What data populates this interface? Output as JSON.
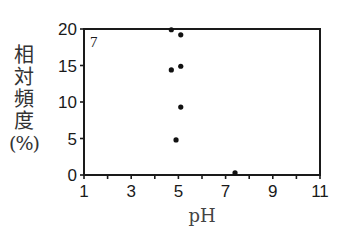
{
  "chart_data": {
    "type": "scatter",
    "title": "",
    "panel_label": "7",
    "xlabel": "pH",
    "ylabel": "相対頻度(%)",
    "ylabel_chars": [
      "相",
      "対",
      "頻",
      "度",
      "(%)"
    ],
    "xlim": [
      1,
      11
    ],
    "ylim": [
      0,
      20
    ],
    "x_ticks": [
      1,
      2,
      3,
      4,
      5,
      6,
      7,
      8,
      9,
      10,
      11
    ],
    "x_tick_labels": [
      "1",
      "3",
      "5",
      "7",
      "9",
      "11"
    ],
    "x_tick_label_values": [
      1,
      3,
      5,
      7,
      9,
      11
    ],
    "y_ticks": [
      0,
      5,
      10,
      15,
      20
    ],
    "y_tick_labels": [
      "0",
      "5",
      "10",
      "15",
      "20"
    ],
    "grid": false,
    "legend": null,
    "points": [
      {
        "x": 4.7,
        "y": 19.9
      },
      {
        "x": 5.1,
        "y": 19.2
      },
      {
        "x": 4.7,
        "y": 14.4
      },
      {
        "x": 5.1,
        "y": 14.9
      },
      {
        "x": 5.1,
        "y": 9.3
      },
      {
        "x": 4.9,
        "y": 4.8
      },
      {
        "x": 7.4,
        "y": 0.3
      }
    ],
    "colors": {
      "axis": "#1a1a1a",
      "marker": "#111111",
      "text": "#1a1a1a"
    }
  }
}
